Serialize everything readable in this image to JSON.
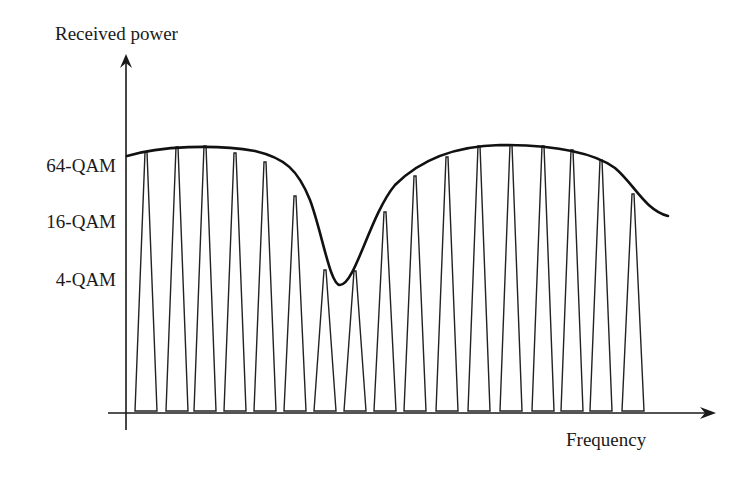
{
  "diagram": {
    "y_axis_label": "Received power",
    "x_axis_label": "Frequency",
    "levels": [
      {
        "label": "64-QAM",
        "y": 166
      },
      {
        "label": "16-QAM",
        "y": 222
      },
      {
        "label": "4-QAM",
        "y": 280
      }
    ],
    "colors": {
      "line": "#1a1a1a",
      "background": "#ffffff"
    },
    "subcarriers": [
      {
        "x": 146,
        "apex": 152
      },
      {
        "x": 177,
        "apex": 147
      },
      {
        "x": 205,
        "apex": 146
      },
      {
        "x": 235,
        "apex": 153
      },
      {
        "x": 265,
        "apex": 162
      },
      {
        "x": 295,
        "apex": 196
      },
      {
        "x": 325,
        "apex": 270
      },
      {
        "x": 355,
        "apex": 271
      },
      {
        "x": 385,
        "apex": 212
      },
      {
        "x": 415,
        "apex": 176
      },
      {
        "x": 447,
        "apex": 157
      },
      {
        "x": 479,
        "apex": 146
      },
      {
        "x": 511,
        "apex": 145
      },
      {
        "x": 543,
        "apex": 146
      },
      {
        "x": 572,
        "apex": 150
      },
      {
        "x": 601,
        "apex": 160
      },
      {
        "x": 633,
        "apex": 194
      }
    ],
    "channel_curve": "M127,156 C160,146 215,144 255,151 C285,158 298,170 310,200 C322,232 330,285 340,285 C355,285 370,215 395,185 C420,160 455,146 500,145 C545,145 590,150 615,168 C635,185 645,210 668,216"
  }
}
